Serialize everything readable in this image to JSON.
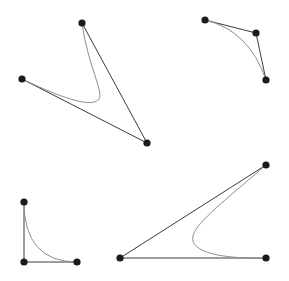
{
  "figure": {
    "width": 289,
    "height": 281,
    "background_color": "#ffffff",
    "polygon_color": "#3a3a42",
    "curve_color": "#8d8d93",
    "point_color": "#1b1b1f",
    "point_radius": 3.6,
    "polygon_stroke_width": 1,
    "curve_stroke_width": 1,
    "panel_count": 4
  },
  "chart_data": {
    "type": "scatter",
    "xlabel": "",
    "ylabel": "",
    "xlim": [
      0,
      289
    ],
    "ylim": [
      281,
      0
    ],
    "grid": false,
    "legend": "none",
    "series": [
      {
        "name": "panel-top-left",
        "kind": "quadratic-bezier-extended",
        "control_points": [
          {
            "label": "P0",
            "x": 82,
            "y": 23
          },
          {
            "label": "P1",
            "x": 147,
            "y": 143
          },
          {
            "label": "P2",
            "x": 22,
            "y": 79
          }
        ],
        "polygon_path": "M 82 23 L 147 143 L 22 79",
        "curve_path": "M 82 23 C 88 66 104 92 99 99 C 93 107 70 102 22 79",
        "values": [
          23,
          143,
          79
        ]
      },
      {
        "name": "panel-top-right",
        "kind": "quadratic-bezier",
        "control_points": [
          {
            "label": "P0",
            "x": 205,
            "y": 20
          },
          {
            "label": "P1",
            "x": 256,
            "y": 33
          },
          {
            "label": "P2",
            "x": 266,
            "y": 80
          }
        ],
        "polygon_path": "M 205 20 L 256 33 L 266 80",
        "curve_path": "M 205 20 Q 249 30 266 80",
        "values": [
          20,
          33,
          80
        ]
      },
      {
        "name": "panel-bottom-left",
        "kind": "quadratic-bezier",
        "control_points": [
          {
            "label": "P0",
            "x": 24,
            "y": 202
          },
          {
            "label": "P1",
            "x": 24,
            "y": 262
          },
          {
            "label": "P2",
            "x": 77,
            "y": 262
          }
        ],
        "polygon_path": "M 24 202 L 24 262 L 77 262",
        "curve_path": "M 24 202 Q 24 262 77 262",
        "values": [
          202,
          262,
          262
        ]
      },
      {
        "name": "panel-bottom-right",
        "kind": "quadratic-bezier-extended",
        "control_points": [
          {
            "label": "P0",
            "x": 266,
            "y": 165
          },
          {
            "label": "P1",
            "x": 120,
            "y": 258
          },
          {
            "label": "P2",
            "x": 266,
            "y": 258
          }
        ],
        "polygon_path": "M 266 165 L 120 258 L 266 258",
        "curve_path": "M 266 165 C 228 198 196 222 193 236 C 189 253 224 259 266 258",
        "values": [
          165,
          258,
          258
        ]
      }
    ]
  }
}
